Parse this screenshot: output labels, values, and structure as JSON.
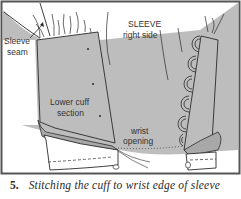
{
  "figure": {
    "labels": {
      "sleeve_seam_line1": "Sleeve",
      "sleeve_seam_line2": "seam",
      "sleeve_right_side_line1": "SLEEVE",
      "sleeve_right_side_line2": "right side",
      "lower_cuff_line1": "Lower cuff",
      "lower_cuff_line2": "section",
      "wrist_opening_line1": "wrist",
      "wrist_opening_line2": "opening"
    },
    "colors": {
      "fabric": "#bdbdbd",
      "fabric_dark": "#a8a8a8",
      "outline": "#2b2b2b",
      "frame": "#555555",
      "paper": "#ffffff"
    }
  },
  "caption": {
    "number": "5.",
    "text": "Stitching the cuff to wrist edge of sleeve"
  }
}
